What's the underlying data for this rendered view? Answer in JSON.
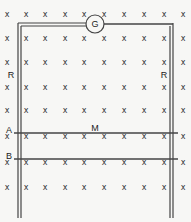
{
  "diagram": {
    "field_symbol": "x",
    "cross_columns_x": [
      7,
      26,
      45,
      65,
      84,
      104,
      124,
      144,
      164,
      183
    ],
    "cross_rows_y": [
      15,
      39,
      63,
      88,
      111,
      137,
      163,
      188
    ],
    "galvanometer": {
      "label": "G",
      "cx": 95,
      "cy": 24,
      "r": 9
    },
    "rails": {
      "left_label": "R",
      "right_label": "R"
    },
    "rods": [
      {
        "label": "A",
        "y": 133
      },
      {
        "label": "B",
        "y": 159
      }
    ],
    "mid_label": "M",
    "colors": {
      "line": "#444444",
      "text": "#222222",
      "background": "#f7f7f5"
    }
  }
}
